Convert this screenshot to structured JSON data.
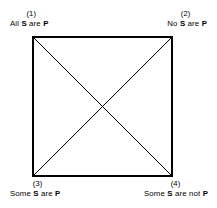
{
  "diagram": {
    "name": "square-of-opposition",
    "line_color": "#000000",
    "background_color": "#ffffff",
    "border_width_px": 2,
    "diagonal_width_px": 1,
    "corners": [
      {
        "position": "top-left",
        "index": "(1)",
        "prefix": "All ",
        "subject": "S",
        "middle": " are ",
        "predicate": "P",
        "full_text": "All S are P"
      },
      {
        "position": "top-right",
        "index": "(2)",
        "prefix": "No ",
        "subject": "S",
        "middle": " are ",
        "predicate": "P",
        "full_text": "No S are P"
      },
      {
        "position": "bottom-left",
        "index": "(3)",
        "prefix": "Some ",
        "subject": "S",
        "middle": " are ",
        "predicate": "P",
        "full_text": "Some S are P"
      },
      {
        "position": "bottom-right",
        "index": "(4)",
        "prefix": "Some ",
        "subject": "S",
        "middle": " are not ",
        "predicate": "P",
        "full_text": "Some S are not P"
      }
    ]
  }
}
